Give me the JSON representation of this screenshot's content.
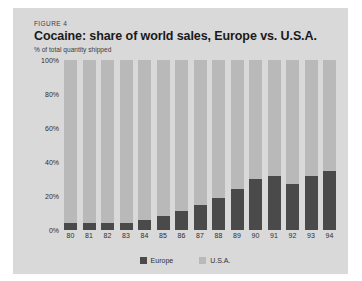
{
  "figure": {
    "label": "FIGURE 4",
    "title": "Cocaine: share of world sales, Europe vs. U.S.A.",
    "subtitle": "% of total quantity shipped"
  },
  "legend": {
    "items": [
      {
        "label": "Europe",
        "color": "#4a4a4a"
      },
      {
        "label": "U.S.A.",
        "color": "#b9b9b9"
      }
    ]
  },
  "axis": {
    "y_ticks": [
      "100%",
      "80%",
      "60%",
      "40%",
      "20%",
      "0%"
    ],
    "x_ticks": [
      "80",
      "81",
      "82",
      "83",
      "84",
      "85",
      "86",
      "87",
      "88",
      "89",
      "90",
      "91",
      "92",
      "93",
      "94"
    ]
  },
  "chart_data": {
    "type": "bar",
    "stacked": true,
    "title": "Cocaine: share of world sales, Europe vs. U.S.A.",
    "subtitle": "% of total quantity shipped",
    "xlabel": "",
    "ylabel": "% of total quantity shipped",
    "ylim": [
      0,
      100
    ],
    "ytick_values": [
      0,
      20,
      40,
      60,
      80,
      100
    ],
    "grid": false,
    "legend_position": "bottom-center",
    "categories": [
      "80",
      "81",
      "82",
      "83",
      "84",
      "85",
      "86",
      "87",
      "88",
      "89",
      "90",
      "91",
      "92",
      "93",
      "94"
    ],
    "series": [
      {
        "name": "Europe",
        "color": "#4a4a4a",
        "values": [
          4,
          4,
          4,
          4,
          6,
          8,
          11,
          15,
          19,
          24,
          30,
          32,
          27,
          32,
          35
        ]
      },
      {
        "name": "U.S.A.",
        "color": "#b9b9b9",
        "values": [
          96,
          96,
          96,
          96,
          94,
          92,
          89,
          85,
          81,
          76,
          70,
          68,
          73,
          68,
          65
        ]
      }
    ]
  }
}
